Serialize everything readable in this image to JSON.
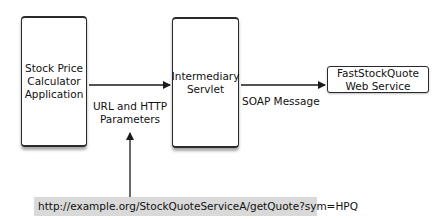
{
  "nodes": {
    "app": {
      "line1": "Stock Price",
      "line2": "Calculator",
      "line3": "Application"
    },
    "servlet": {
      "line1": "Intermediary",
      "line2": "Servlet"
    },
    "web_service": {
      "line1": "FastStockQuote",
      "line2": "Web Service"
    }
  },
  "edges": {
    "app_to_servlet": {
      "line1": "URL and HTTP",
      "line2": "Parameters"
    },
    "servlet_to_ws": {
      "label": "SOAP Message"
    }
  },
  "example_url": "http://example.org/StockQuoteServiceA/getQuote?sym=HPQ",
  "colors": {
    "stroke": "#2a2a2a",
    "url_background": "#d9d9d9"
  }
}
